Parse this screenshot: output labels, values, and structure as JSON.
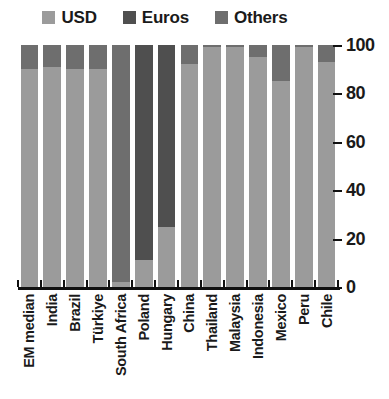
{
  "chart_data": {
    "type": "bar",
    "subtype": "stacked-100-percent",
    "title": "",
    "subtitle": "",
    "xlabel": "",
    "ylabel": "",
    "ylim": [
      0,
      100
    ],
    "yticks": [
      0,
      20,
      40,
      60,
      80,
      100
    ],
    "ytick_labels": [
      "0",
      "20",
      "40",
      "60",
      "80",
      "100"
    ],
    "grid": false,
    "legend_position": "top",
    "axis_side": "right",
    "categories": [
      "EM median",
      "India",
      "Brazil",
      "Türkiye",
      "South Africa",
      "Poland",
      "Hungary",
      "China",
      "Thailand",
      "Malaysia",
      "Indonesia",
      "Mexico",
      "Peru",
      "Chile"
    ],
    "series": [
      {
        "name": "USD",
        "color": "#9b9b9b",
        "values": [
          90,
          91,
          90,
          90,
          2,
          11,
          25,
          92,
          99,
          99,
          95,
          85,
          99,
          93
        ]
      },
      {
        "name": "Euros",
        "color": "#4f4f4f",
        "values": [
          0,
          0,
          0,
          0,
          0,
          89,
          75,
          0,
          0,
          0,
          0,
          0,
          0,
          0
        ]
      },
      {
        "name": "Others",
        "color": "#6e6e6e",
        "values": [
          10,
          9,
          10,
          10,
          98,
          0,
          0,
          8,
          1,
          1,
          5,
          15,
          1,
          7
        ]
      }
    ]
  },
  "legend": {
    "items": [
      {
        "label": "USD",
        "color": "#9b9b9b"
      },
      {
        "label": "Euros",
        "color": "#4f4f4f"
      },
      {
        "label": "Others",
        "color": "#6e6e6e"
      }
    ]
  },
  "colors": {
    "usd": "#9b9b9b",
    "euros": "#4f4f4f",
    "others": "#6e6e6e",
    "axis": "#111111",
    "background": "#ffffff"
  }
}
